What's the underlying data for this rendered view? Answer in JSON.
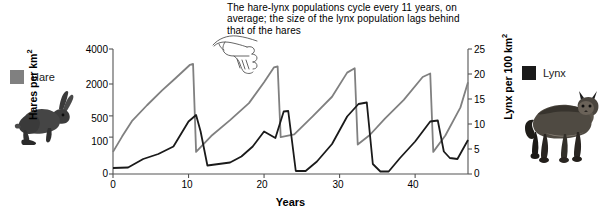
{
  "annotation": {
    "text": "The hare-lynx populations cycle every 11 years, on average; the size of the lynx population lags behind that of the hares",
    "pointer_icon": "pointing-hand-icon"
  },
  "legend": {
    "hare": {
      "label": "Hare",
      "color": "#808080",
      "animal_icon": "hare-illustration"
    },
    "lynx": {
      "label": "Lynx",
      "color": "#1a1a1a",
      "animal_icon": "lynx-illustration"
    }
  },
  "chart_data": {
    "type": "line",
    "title": "",
    "xlabel": "Years",
    "ylabel": "Hares per km2",
    "ylabel_right": "Lynx per 100 km2",
    "ylabel_display": "Hares per km",
    "ylabel_sup": "2",
    "ylabel_right_display": "Lynx per 100 km",
    "ylabel_right_sup": "2",
    "grid": false,
    "legend_position": "outside-left-and-right",
    "xlim": [
      0,
      47
    ],
    "xticks": [
      0,
      10,
      20,
      30,
      40
    ],
    "xtick_labels": [
      "0",
      "10",
      "20",
      "30",
      "40"
    ],
    "y_left_scale": "nonlinear-compressed",
    "y_left_ticks": [
      0,
      100,
      500,
      2000,
      4000
    ],
    "y_left_tick_labels": [
      "0",
      "100",
      "500",
      "2000",
      "4000"
    ],
    "y_left_tick_pixel_fractions": [
      0.0,
      0.295,
      0.465,
      0.72,
      1.0
    ],
    "ylim_left": [
      0,
      4000
    ],
    "y_right_scale": "linear",
    "y_right_ticks": [
      0,
      5,
      10,
      15,
      20,
      25
    ],
    "y_right_tick_labels": [
      "0",
      "5",
      "10",
      "15",
      "20",
      "25"
    ],
    "ylim_right": [
      0,
      25
    ],
    "series": [
      {
        "name": "Hare",
        "color": "#808080",
        "axis": "left",
        "unit": "hares per km2",
        "x": [
          0,
          1.2,
          2.5,
          4.5,
          6.5,
          8.2,
          10.2,
          10.6,
          11.0,
          13.0,
          15.5,
          18.0,
          20.0,
          21.3,
          21.8,
          22.2,
          24.0,
          26.5,
          29.0,
          31.0,
          32.0,
          32.4,
          34.0,
          36.0,
          38.5,
          41.0,
          42.0,
          42.4,
          44.0,
          46.0,
          47.0
        ],
        "y": [
          60,
          110,
          400,
          1000,
          1700,
          2300,
          3100,
          3150,
          60,
          120,
          420,
          1100,
          2100,
          2950,
          3000,
          100,
          150,
          500,
          1400,
          2650,
          2900,
          80,
          140,
          450,
          1250,
          2400,
          2600,
          60,
          130,
          900,
          2100
        ]
      },
      {
        "name": "Lynx",
        "color": "#1a1a1a",
        "axis": "right",
        "unit": "lynx per 100 km2",
        "x": [
          0,
          2.0,
          4.0,
          6.0,
          8.0,
          10.0,
          11.0,
          11.6,
          12.5,
          14.0,
          15.5,
          17.0,
          18.5,
          20.0,
          21.5,
          22.6,
          23.2,
          24.2,
          25.5,
          27.0,
          29.0,
          31.0,
          32.5,
          33.6,
          34.4,
          35.4,
          36.5,
          38.0,
          40.0,
          42.0,
          43.0,
          43.8,
          44.6,
          45.6,
          47.0
        ],
        "y": [
          1.2,
          1.3,
          3.0,
          4.0,
          5.5,
          10.5,
          11.8,
          8.5,
          1.7,
          2.0,
          2.3,
          3.5,
          5.5,
          8.5,
          7.2,
          12.5,
          12.6,
          0.6,
          0.6,
          2.5,
          6.0,
          11.5,
          14.0,
          14.3,
          2.0,
          0.5,
          0.5,
          3.2,
          6.5,
          10.5,
          10.7,
          4.5,
          3.2,
          3.0,
          6.8
        ]
      }
    ]
  }
}
